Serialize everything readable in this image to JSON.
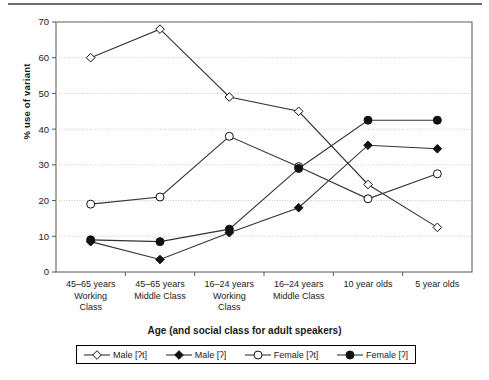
{
  "chart_data": {
    "type": "line",
    "title": "",
    "xlabel": "Age (and social class for adult speakers)",
    "ylabel": "% use of variant",
    "ylim": [
      0,
      70
    ],
    "yticks": [
      0,
      10,
      20,
      30,
      40,
      50,
      60,
      70
    ],
    "grid": true,
    "legend_position": "bottom",
    "categories": [
      "45–65 years Working Class",
      "45–65 years Middle Class",
      "16–24 years Working Class",
      "16–24 years Middle Class",
      "10 year olds",
      "5 year olds"
    ],
    "category_lines": [
      [
        "45–65 years",
        "Working",
        "Class"
      ],
      [
        "45–65 years",
        "Middle Class"
      ],
      [
        "16–24 years",
        "Working",
        "Class"
      ],
      [
        "16–24 years",
        "Middle Class"
      ],
      [
        "10 year olds"
      ],
      [
        "5 year olds"
      ]
    ],
    "series": [
      {
        "name": "Male [ʔt]",
        "marker": "open-diamond",
        "values": [
          60,
          68,
          49,
          45,
          24.5,
          12.5
        ]
      },
      {
        "name": "Male [ʔ]",
        "marker": "filled-diamond",
        "values": [
          8.5,
          3.5,
          11,
          18,
          35.5,
          34.5
        ]
      },
      {
        "name": "Female [ʔt]",
        "marker": "open-circle",
        "values": [
          19,
          21,
          38,
          29.5,
          20.5,
          27.5
        ]
      },
      {
        "name": "Female [ʔ]",
        "marker": "filled-circle",
        "values": [
          9,
          8.5,
          12,
          29,
          42.5,
          42.5
        ]
      }
    ]
  },
  "legend": {
    "items": [
      {
        "label": "Male [ʔt]",
        "marker": "open-diamond"
      },
      {
        "label": "Male [ʔ]",
        "marker": "filled-diamond"
      },
      {
        "label": "Female [ʔt]",
        "marker": "open-circle"
      },
      {
        "label": "Female [ʔ]",
        "marker": "filled-circle"
      }
    ]
  },
  "colors": {
    "line": "#333333",
    "axis": "#555555",
    "grid": "#c8c8c8",
    "text": "#1a1a1a"
  }
}
